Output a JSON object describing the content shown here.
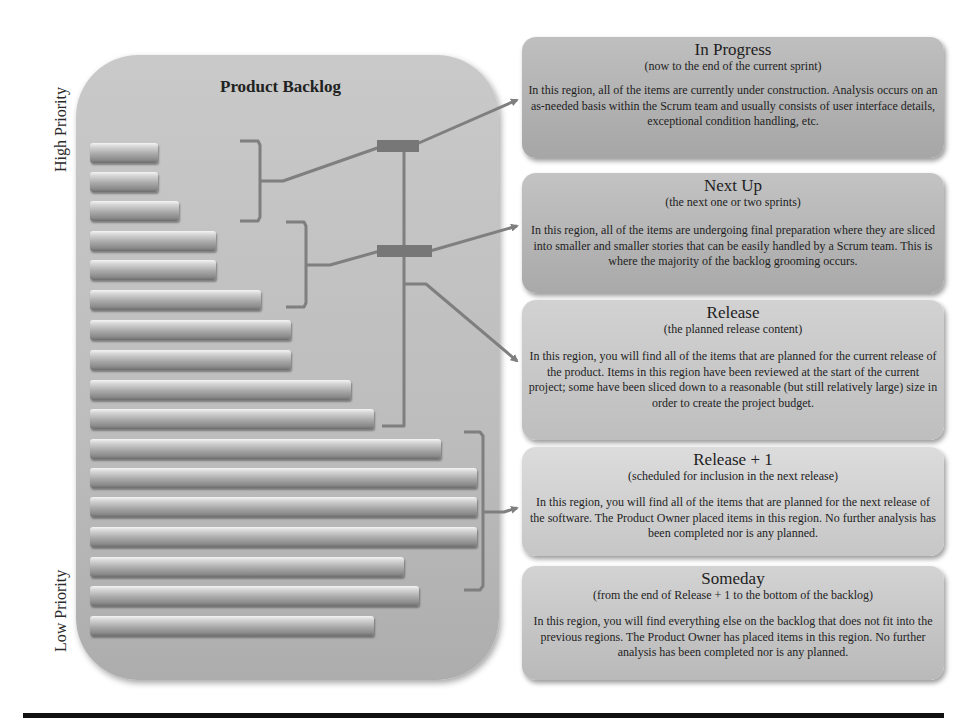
{
  "axis_labels": {
    "high_priority": "High Priority",
    "low_priority": "Low Priority"
  },
  "backlog": {
    "title": "Product Backlog",
    "bars": [
      {
        "top": 143,
        "right": 158
      },
      {
        "top": 172,
        "right": 158
      },
      {
        "top": 201,
        "right": 179
      },
      {
        "top": 231,
        "right": 216
      },
      {
        "top": 260,
        "right": 216
      },
      {
        "top": 290,
        "right": 261
      },
      {
        "top": 320,
        "right": 291
      },
      {
        "top": 350,
        "right": 291
      },
      {
        "top": 380,
        "right": 351
      },
      {
        "top": 409,
        "right": 374
      },
      {
        "top": 439,
        "right": 441
      },
      {
        "top": 468,
        "right": 477
      },
      {
        "top": 497,
        "right": 477
      },
      {
        "top": 527,
        "right": 477
      },
      {
        "top": 557,
        "right": 404
      },
      {
        "top": 586,
        "right": 419
      },
      {
        "top": 616,
        "right": 374
      }
    ]
  },
  "regions": [
    {
      "title": "In Progress",
      "subtitle": "(now to the end of the current sprint)",
      "body": "In this region, all of the items are currently under construction. Analysis occurs on an as-needed basis within the Scrum team and usually consists of user interface details, exceptional condition handling, etc."
    },
    {
      "title": "Next Up",
      "subtitle": "(the next one or two sprints)",
      "body": "In this region, all of the items are undergoing final preparation where they are sliced into smaller and smaller stories that can be easily handled by a Scrum team. This is where the majority of the backlog grooming occurs."
    },
    {
      "title": "Release",
      "subtitle": "(the planned release content)",
      "body": "In this region, you will find all of the items that are planned for the current release of the product. Items in this region have been reviewed at the start of the current project; some have been sliced down to a reasonable (but still relatively large) size in order to create the project budget."
    },
    {
      "title": "Release + 1",
      "subtitle": "(scheduled for inclusion in the next release)",
      "body": "In this region, you will find all of the items that are planned for the next release of the software. The Product Owner placed items in this region. No further analysis has been completed nor is any planned."
    },
    {
      "title": "Someday",
      "subtitle": "(from the end of Release + 1 to the bottom of the backlog)",
      "body": "In this region, you will find everything else on the backlog that does not fit into the previous regions. The Product Owner has placed items in this region. No further analysis has been completed nor is any planned."
    }
  ],
  "colors": {
    "connector": "#7f7f7f",
    "connector_block": "#777777",
    "rule": "#111111"
  }
}
